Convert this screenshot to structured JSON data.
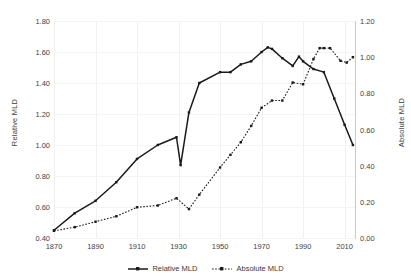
{
  "chart_data": {
    "type": "line",
    "title": "",
    "xlabel": "",
    "ylabel": "Relative MLD",
    "y2label": "Absolute MLD",
    "grid": true,
    "legend_position": "bottom",
    "xlim": [
      1870,
      2015
    ],
    "ylim": [
      0.4,
      1.8
    ],
    "y2lim": [
      0.0,
      1.2
    ],
    "xticks": [
      1870,
      1890,
      1910,
      1930,
      1950,
      1970,
      1990,
      2010
    ],
    "xtick_labels": [
      "1870",
      "1890",
      "1910",
      "1930",
      "1950",
      "1970",
      "1990",
      "2010"
    ],
    "yticks": [
      0.4,
      0.6,
      0.8,
      1.0,
      1.2,
      1.4,
      1.6,
      1.8
    ],
    "ytick_labels": [
      "0.40",
      "0.60",
      "0.80",
      "1.00",
      "1.20",
      "1.40",
      "1.60",
      "1.80"
    ],
    "y2ticks": [
      0.0,
      0.2,
      0.4,
      0.6,
      0.8,
      1.0,
      1.2
    ],
    "y2tick_labels": [
      "0.00",
      "0.20",
      "0.40",
      "0.60",
      "0.80",
      "1.00",
      "1.20"
    ],
    "series": [
      {
        "name": "Relative MLD",
        "axis": "left",
        "style": "solid",
        "marker": "square",
        "color": "#1a1a1a",
        "x": [
          1870,
          1880,
          1890,
          1900,
          1910,
          1920,
          1929,
          1931,
          1935,
          1940,
          1950,
          1955,
          1960,
          1965,
          1970,
          1973,
          1975,
          1980,
          1985,
          1988,
          1990,
          1995,
          2000,
          2005,
          2010,
          2014
        ],
        "y": [
          0.45,
          0.56,
          0.64,
          0.76,
          0.91,
          1.0,
          1.05,
          0.87,
          1.21,
          1.4,
          1.47,
          1.47,
          1.52,
          1.54,
          1.6,
          1.63,
          1.62,
          1.56,
          1.51,
          1.57,
          1.54,
          1.49,
          1.47,
          1.3,
          1.13,
          1.0
        ]
      },
      {
        "name": "Absolute MLD",
        "axis": "right",
        "style": "dotted",
        "marker": "square",
        "color": "#1a1a1a",
        "x": [
          1870,
          1880,
          1890,
          1900,
          1910,
          1920,
          1929,
          1935,
          1940,
          1950,
          1955,
          1960,
          1965,
          1970,
          1975,
          1980,
          1985,
          1990,
          1995,
          1998,
          2000,
          2003,
          2008,
          2011,
          2014
        ],
        "y": [
          0.04,
          0.06,
          0.09,
          0.12,
          0.17,
          0.18,
          0.22,
          0.16,
          0.24,
          0.39,
          0.46,
          0.53,
          0.62,
          0.72,
          0.76,
          0.76,
          0.86,
          0.85,
          0.99,
          1.05,
          1.05,
          1.05,
          0.98,
          0.97,
          1.0
        ]
      }
    ]
  },
  "legend": {
    "items": [
      {
        "label": "Relative MLD"
      },
      {
        "label": "Absolute MLD"
      }
    ]
  }
}
